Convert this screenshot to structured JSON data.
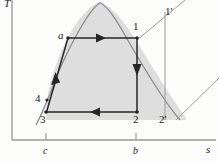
{
  "figure": {
    "type": "thermodynamic-Ts-diagram",
    "axes": {
      "y_label": "T",
      "x_label": "s",
      "x_ticks": [
        {
          "label": "c",
          "x": 46
        },
        {
          "label": "b",
          "x": 136
        }
      ]
    },
    "state_points": [
      {
        "label": "a",
        "x": 68,
        "y": 38,
        "label_x": 58,
        "label_y": 32
      },
      {
        "label": "1",
        "x": 137,
        "y": 38,
        "label_x": 133,
        "label_y": 23
      },
      {
        "label": "1'",
        "x": 168,
        "y": 12,
        "label_x": 166,
        "label_y": 8
      },
      {
        "label": "2",
        "x": 137,
        "y": 112,
        "label_x": 133,
        "label_y": 116
      },
      {
        "label": "2'",
        "x": 165,
        "y": 112,
        "label_x": 159,
        "label_y": 116
      },
      {
        "label": "3",
        "x": 46,
        "y": 112,
        "label_x": 41,
        "label_y": 116
      },
      {
        "label": "4",
        "x": 47,
        "y": 100,
        "label_x": 36,
        "label_y": 94
      }
    ],
    "processes": [
      {
        "from": "a",
        "to": "1",
        "kind": "isothermal-heating",
        "arrow": "right"
      },
      {
        "from": "1",
        "to": "2",
        "kind": "isentropic-expansion",
        "arrow": "down"
      },
      {
        "from": "2",
        "to": "3",
        "kind": "isothermal-rejection",
        "arrow": "left"
      },
      {
        "from": "3",
        "to": "a",
        "kind": "compression",
        "arrow": "up"
      }
    ],
    "colors": {
      "curve": "#8a8a8a",
      "line": "#262626",
      "fill": "#dedede",
      "axis": "#9a9a9a",
      "text": "#1a1a1a"
    },
    "regions": {
      "dome_fill_label": "saturation-dome-shaded-area"
    }
  }
}
